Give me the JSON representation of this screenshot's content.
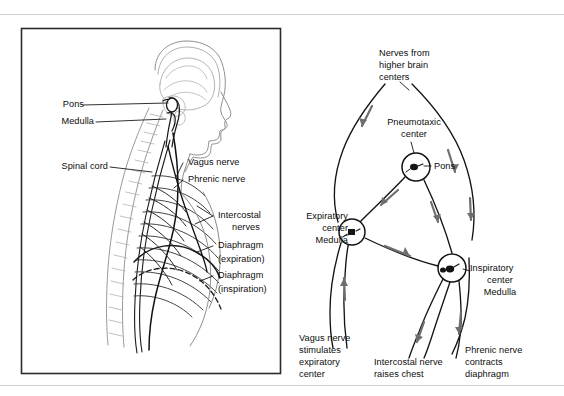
{
  "figure": {
    "panels": [
      {
        "id": "left-panel",
        "name": "anatomical-sagittal-view",
        "description": "Sagittal view of head, neck and thorax showing respiratory centers and nerves"
      },
      {
        "id": "right-panel",
        "name": "respiratory-control-schematic",
        "description": "Schematic loop diagram of respiratory control centers and nerve pathways"
      }
    ],
    "colors": {
      "ink": "#111111",
      "line": "#1a1a1a",
      "faint_anatomy": "#8a8a8a",
      "arrow_gray": "#6e6e6e",
      "panel_border": "#2b2b2b",
      "page_rule": "#c8c8c8",
      "background": "#ffffff"
    }
  },
  "left_panel": {
    "labels": {
      "pons": "Pons",
      "medulla": "Medulla",
      "spinal_cord": "Spinal cord",
      "vagus_nerve": "Vagus nerve",
      "phrenic_nerve": "Phrenic nerve",
      "intercostal_nerves_line1": "Intercostal",
      "intercostal_nerves_line2": "nerves",
      "diaphragm_exp_line1": "Diaphragm",
      "diaphragm_exp_line2": "(expiration)",
      "diaphragm_insp_line1": "Diaphragm",
      "diaphragm_insp_line2": "(inspiration)"
    }
  },
  "right_panel": {
    "labels": {
      "higher_brain_line1": "Nerves from",
      "higher_brain_line2": "higher brain",
      "higher_brain_line3": "centers",
      "pneumotaxic_line1": "Pneumotaxic",
      "pneumotaxic_line2": "center",
      "pons": "Pons",
      "expiratory_line1": "Expiratory",
      "expiratory_line2": "center",
      "expiratory_line3": "Medulla",
      "inspiratory_line1": "Inspiratory",
      "inspiratory_line2": "center",
      "inspiratory_line3": "Medulla",
      "vagus_line1": "Vagus nerve",
      "vagus_line2": "stimulates",
      "vagus_line3": "expiratory",
      "vagus_line4": "center",
      "intercostal_line1": "Intercostal nerve",
      "intercostal_line2": "raises chest",
      "phrenic_line1": "Phrenic nerve",
      "phrenic_line2": "contracts",
      "phrenic_line3": "diaphragm"
    },
    "nodes": [
      {
        "name": "pneumotaxic-center-node",
        "cx": 416,
        "cy": 167,
        "r": 14
      },
      {
        "name": "expiratory-center-node",
        "cx": 352,
        "cy": 232,
        "r": 13
      },
      {
        "name": "inspiratory-center-node",
        "cx": 452,
        "cy": 268,
        "r": 14
      }
    ]
  }
}
